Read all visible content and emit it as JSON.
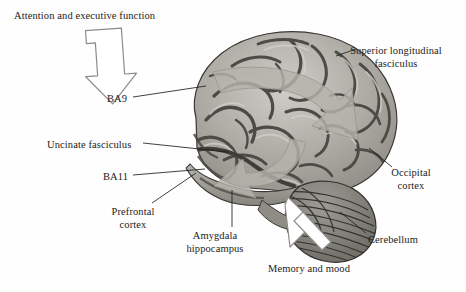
{
  "figure": {
    "kind": "anatomical-diagram",
    "background_color": "#fefefe",
    "ink_color": "#1c1c1c",
    "tract_arrow_color": "#b4b3ab",
    "outline_arrow_fill": "#ffffff",
    "outline_arrow_stroke": "#8d8d86",
    "brain_tones": {
      "gyri_light": "#c3c1bb",
      "gyri_mid": "#a3a19a",
      "sulci_dark": "#4e4c47",
      "outline": "#3a3835"
    }
  },
  "labels": {
    "attention": {
      "text": "Attention and executive function",
      "align": "left",
      "x": 14,
      "y": 10
    },
    "ba9": {
      "text": "BA9",
      "align": "left",
      "x": 107,
      "y": 93
    },
    "uncinate": {
      "text": "Uncinate fasciculus",
      "align": "left",
      "x": 47,
      "y": 139
    },
    "ba11": {
      "text": "BA11",
      "align": "left",
      "x": 103,
      "y": 171
    },
    "prefrontal": {
      "text": "Prefrontal\ncortex",
      "align": "center",
      "x": 133,
      "y": 206
    },
    "amygdala": {
      "text": "Amygdala\nhippocampus",
      "align": "center",
      "x": 215,
      "y": 230
    },
    "memory": {
      "text": "Memory and mood",
      "align": "left",
      "x": 268,
      "y": 263
    },
    "cerebellum": {
      "text": "Cerebellum",
      "align": "left",
      "x": 368,
      "y": 234
    },
    "occipital": {
      "text": "Occipital\ncortex",
      "align": "center",
      "x": 411,
      "y": 167
    },
    "slf": {
      "text": "Superior longitudinal\nfasciculus",
      "align": "center",
      "x": 411,
      "y": 45
    }
  },
  "annotation_arrows": [
    {
      "name": "attention-and-executive-function-arrow",
      "style": "outlined",
      "direction": "down-right",
      "points_to": "BA9 / dorsolateral prefrontal cortex"
    },
    {
      "name": "memory-and-mood-arrow",
      "style": "outlined",
      "direction": "up-left",
      "points_to": "Amygdala / hippocampus"
    }
  ],
  "tract_arrows": [
    {
      "name": "superior-longitudinal-fasciculus-tract-arrow",
      "style": "translucent-grey",
      "direction": "arcs posteriorly, tip down-right toward occipital region"
    },
    {
      "name": "uncinate-fasciculus-tract-arrow",
      "style": "translucent-grey",
      "direction": "hooks forward, tip down-left toward orbitofrontal cortex"
    }
  ],
  "leader_lines": [
    {
      "name": "ba9-leader",
      "from": "BA9 label",
      "to": "dorsolateral frontal gyrus"
    },
    {
      "name": "uncinate-leader",
      "from": "Uncinate fasciculus label",
      "to": "frontal white matter"
    },
    {
      "name": "ba11-leader",
      "from": "BA11 label",
      "to": "orbitofrontal pole"
    },
    {
      "name": "prefrontal-cortex-leader",
      "from": "Prefrontal cortex label",
      "to": "frontal pole"
    },
    {
      "name": "amygdala-hippocampus-leader",
      "from": "Amygdala hippocampus label",
      "to": "medial temporal lobe"
    },
    {
      "name": "cerebellum-leader",
      "from": "Cerebellum label",
      "to": "cerebellar folia"
    },
    {
      "name": "occipital-cortex-leader",
      "from": "Occipital cortex label",
      "to": "occipital pole"
    },
    {
      "name": "superior-longitudinal-fasciculus-leader",
      "from": "Superior longitudinal fasciculus label",
      "to": "parietal white matter"
    }
  ]
}
